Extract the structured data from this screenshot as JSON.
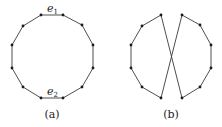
{
  "figure": {
    "panels": [
      {
        "id": "a",
        "caption": "(a)",
        "description": "12-cycle drawn as regular dodecagon",
        "vertices": [
          [
            41,
            15
          ],
          [
            63,
            15
          ],
          [
            82,
            25
          ],
          [
            93,
            45
          ],
          [
            93,
            68
          ],
          [
            82,
            87
          ],
          [
            63,
            98
          ],
          [
            41,
            98
          ],
          [
            23,
            87
          ],
          [
            12,
            68
          ],
          [
            12,
            45
          ],
          [
            23,
            26
          ]
        ],
        "edges": [
          [
            0,
            1
          ],
          [
            1,
            2
          ],
          [
            2,
            3
          ],
          [
            3,
            4
          ],
          [
            4,
            5
          ],
          [
            5,
            6
          ],
          [
            6,
            7
          ],
          [
            7,
            8
          ],
          [
            8,
            9
          ],
          [
            9,
            10
          ],
          [
            10,
            11
          ],
          [
            11,
            0
          ]
        ],
        "edge_labels": [
          {
            "base": "e",
            "sub": "1",
            "x": 47,
            "y": 12
          },
          {
            "base": "e",
            "sub": "2",
            "x": 47,
            "y": 95
          }
        ]
      },
      {
        "id": "b",
        "caption": "(b)",
        "description": "Edges e1 and e2 replaced by two crossing diagonals",
        "vertices": [
          [
            161,
            15
          ],
          [
            182,
            15
          ],
          [
            200,
            25
          ],
          [
            211,
            45
          ],
          [
            211,
            68
          ],
          [
            200,
            87
          ],
          [
            182,
            98
          ],
          [
            161,
            98
          ],
          [
            142,
            87
          ],
          [
            131,
            68
          ],
          [
            131,
            45
          ],
          [
            142,
            26
          ]
        ],
        "edges": [
          [
            1,
            2
          ],
          [
            2,
            3
          ],
          [
            3,
            4
          ],
          [
            4,
            5
          ],
          [
            5,
            6
          ],
          [
            7,
            8
          ],
          [
            8,
            9
          ],
          [
            9,
            10
          ],
          [
            10,
            11
          ],
          [
            11,
            0
          ],
          [
            0,
            6
          ],
          [
            1,
            7
          ]
        ]
      }
    ],
    "colors": {
      "edge": "#3a3a3a",
      "vertex": "#1a1a1a",
      "text": "#222222"
    }
  }
}
